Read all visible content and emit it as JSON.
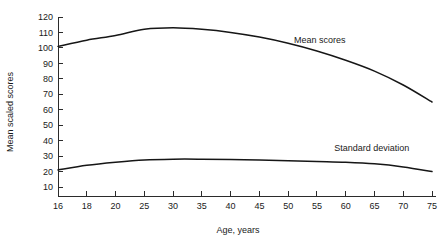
{
  "chart_data": {
    "type": "line",
    "title": "",
    "xlabel": "Age, years",
    "ylabel": "Mean scaled scores",
    "grid": false,
    "legend_position": "inline-annotation",
    "ylim": [
      5,
      120
    ],
    "yticks": [
      10,
      20,
      30,
      40,
      50,
      60,
      70,
      80,
      90,
      100,
      110,
      120
    ],
    "ytick_labels": [
      "10",
      "20",
      "30",
      "40",
      "50",
      "60",
      "70",
      "80",
      "90",
      "100",
      "110",
      "120"
    ],
    "x": [
      16,
      18,
      20,
      25,
      30,
      35,
      40,
      45,
      50,
      55,
      60,
      65,
      70,
      75
    ],
    "xtick_labels": [
      "16",
      "18",
      "20",
      "25",
      "30",
      "35",
      "40",
      "45",
      "50",
      "55",
      "60",
      "65",
      "70",
      "75"
    ],
    "series": [
      {
        "name": "Mean scores",
        "label": "Mean scores",
        "values": [
          101,
          105,
          108,
          112,
          113,
          112,
          110,
          107,
          103,
          98,
          92,
          85,
          76,
          65
        ]
      },
      {
        "name": "Standard deviation",
        "label": "Standard deviation",
        "values": [
          21,
          24,
          26,
          27.5,
          28,
          28,
          27.8,
          27.5,
          27,
          26.5,
          26,
          25,
          23,
          20
        ]
      }
    ],
    "annotations": [
      {
        "text": "Mean scores",
        "x": 51,
        "y": 103
      },
      {
        "text": "Standard deviation",
        "x": 58,
        "y": 33
      }
    ]
  },
  "axes": {
    "y_title": "Mean scaled scores",
    "x_title": "Age, years"
  }
}
